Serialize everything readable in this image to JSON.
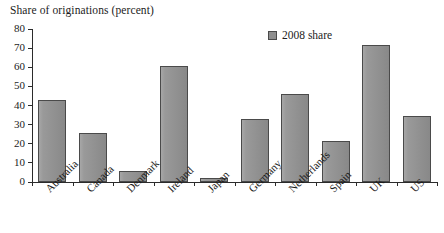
{
  "chart_data": {
    "type": "bar",
    "title": "Share of originations (percent)",
    "xlabel": "",
    "ylabel": "Share of originations (percent)",
    "ylim": [
      0,
      80
    ],
    "ytick_step": 10,
    "yticks": [
      0,
      10,
      20,
      30,
      40,
      50,
      60,
      70,
      80
    ],
    "grid": false,
    "legend_position": "top-right",
    "categories": [
      "Australia",
      "Canada",
      "Denmark",
      "Ireland",
      "Japan",
      "Germany",
      "Netherlands",
      "Spain",
      "UK",
      "US"
    ],
    "series": [
      {
        "name": "2008 share",
        "color": "#8e8e8e",
        "values": [
          43,
          25.5,
          6,
          60.5,
          2,
          33,
          46,
          21.5,
          71.5,
          34.5
        ]
      }
    ]
  },
  "legend": {
    "entries": [
      {
        "label": "2008 share",
        "swatch": "legend-swatch-gray"
      }
    ]
  },
  "colors": {
    "bar_fill": "#8e8e8e",
    "bar_stroke": "#4a4a4a",
    "axis": "#2b2b2b",
    "text": "#1c1c1c",
    "background": "#ffffff"
  }
}
